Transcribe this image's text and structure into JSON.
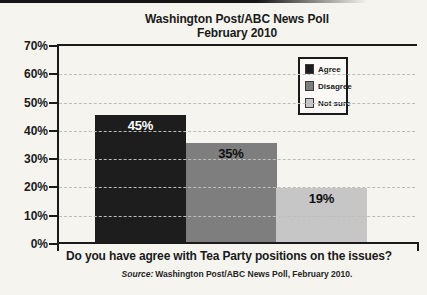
{
  "title": {
    "line1": "Washington Post/ABC News Poll",
    "line2": "February 2010"
  },
  "chart_data": {
    "type": "bar",
    "categories": [
      "Agree",
      "Disagree",
      "Not sure"
    ],
    "values": [
      45,
      35,
      19
    ],
    "value_labels": [
      "45%",
      "35%",
      "19%"
    ],
    "colors": [
      "#1d1d1d",
      "#7e7e7e",
      "#c6c6c6"
    ],
    "value_label_colors": [
      "#ffffff",
      "#101010",
      "#101010"
    ],
    "xlabel": "Do you have agree with Tea Party positions on the issues?",
    "ylabel": "",
    "ylim": [
      0,
      70
    ],
    "ytick_labels": [
      "70%",
      "60%",
      "50%",
      "40%",
      "30%",
      "20%",
      "10%",
      "0%"
    ],
    "grid": "horizontal-dashed",
    "legend_position": "top-right"
  },
  "legend": {
    "items": [
      {
        "label": "Agree"
      },
      {
        "label": "Disagree"
      },
      {
        "label": "Not sure"
      }
    ]
  },
  "footer": {
    "question": "Do you have agree with Tea Party positions on the issues?",
    "source_prefix": "Source:",
    "source_text": "Washington Post/ABC News Poll, February 2010."
  }
}
